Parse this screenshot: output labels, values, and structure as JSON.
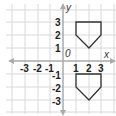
{
  "diagram": {
    "type": "coordinate-plane",
    "x_axis_label": "x",
    "y_axis_label": "y",
    "origin_label": "0",
    "x_ticks": [
      "-3",
      "-2",
      "-1",
      "1",
      "2",
      "3"
    ],
    "y_ticks": [
      "3",
      "2",
      "1",
      "-1",
      "-2",
      "-3"
    ],
    "range": {
      "x": [
        -3,
        3
      ],
      "y": [
        -3,
        3
      ]
    },
    "colors": {
      "grid": "#d8d8d8",
      "axis": "#aaaaaa",
      "shape": "#333333",
      "text": "#222222"
    },
    "shapes": [
      {
        "name": "pentagon-upper",
        "points": [
          [
            1,
            3
          ],
          [
            3,
            3
          ],
          [
            3,
            2
          ],
          [
            2,
            1
          ],
          [
            1,
            2
          ]
        ]
      },
      {
        "name": "pentagon-lower",
        "points": [
          [
            1,
            -1
          ],
          [
            3,
            -1
          ],
          [
            3,
            -2
          ],
          [
            2,
            -3
          ],
          [
            1,
            -2
          ]
        ]
      }
    ]
  }
}
